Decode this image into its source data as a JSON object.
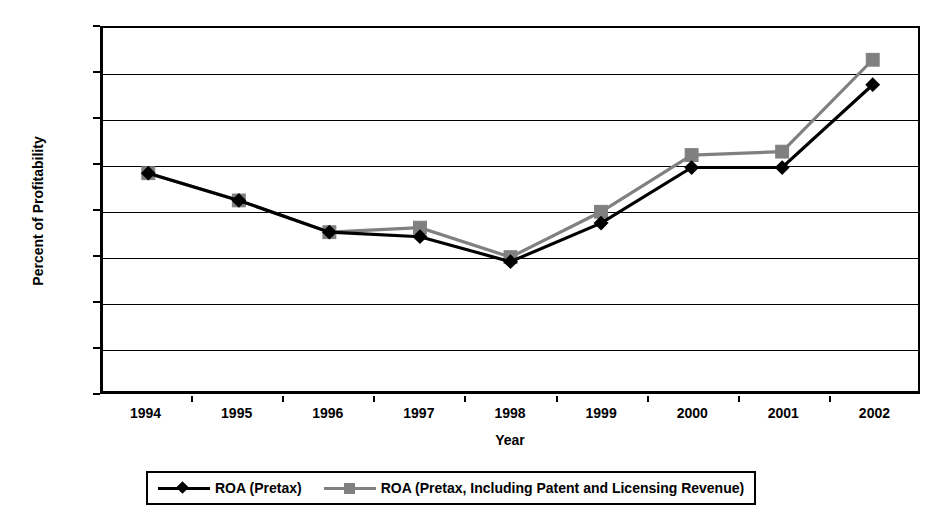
{
  "chart_data": {
    "type": "line",
    "title": "",
    "xlabel": "Year",
    "ylabel": "Percent of Profitability",
    "categories": [
      "1994",
      "1995",
      "1996",
      "1997",
      "1998",
      "1999",
      "2000",
      "2001",
      "2002"
    ],
    "x": [
      1994,
      1995,
      1996,
      1997,
      1998,
      1999,
      2000,
      2001,
      2002
    ],
    "ylim": [
      0,
      16
    ],
    "ytick_labels": [
      "0",
      "2",
      "4",
      "6",
      "8",
      "10",
      "12",
      "14",
      "16"
    ],
    "ytick_values": [
      0,
      2,
      4,
      6,
      8,
      10,
      12,
      14,
      16
    ],
    "grid": "horizontal",
    "legend_position": "bottom",
    "series": [
      {
        "name": "ROA (Pretax)",
        "marker": "diamond",
        "color": "#000000",
        "values": [
          9.6,
          8.4,
          7.0,
          6.8,
          5.7,
          7.4,
          9.85,
          9.85,
          13.5
        ]
      },
      {
        "name": "ROA (Pretax, Including Patent and Licensing Revenue)",
        "marker": "square",
        "color": "#808080",
        "values": [
          9.6,
          8.4,
          7.0,
          7.2,
          5.9,
          7.9,
          10.4,
          10.55,
          14.6
        ]
      }
    ]
  },
  "legend": {
    "entries": [
      {
        "label": "ROA (Pretax)"
      },
      {
        "label": "ROA (Pretax, Including Patent and Licensing Revenue)"
      }
    ]
  },
  "axis": {
    "y_title": "Percent of Profitability",
    "x_title": "Year"
  }
}
